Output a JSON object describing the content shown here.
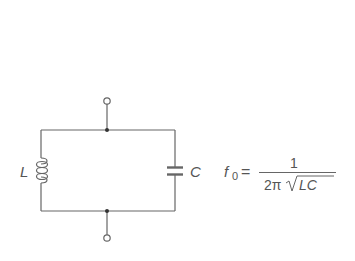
{
  "diagram": {
    "type": "LC parallel resonant circuit",
    "components": [
      {
        "id": "inductor",
        "label": "L"
      },
      {
        "id": "capacitor",
        "label": "C"
      }
    ],
    "terminals": [
      "top",
      "bottom"
    ],
    "formula": {
      "lhs": "f",
      "lhs_subscript": "0",
      "equals": "=",
      "numerator": "1",
      "denominator_prefix": "2π",
      "radicand": "LC"
    },
    "colors": {
      "line": "#666666",
      "text": "#555555",
      "background": "#ffffff"
    }
  }
}
